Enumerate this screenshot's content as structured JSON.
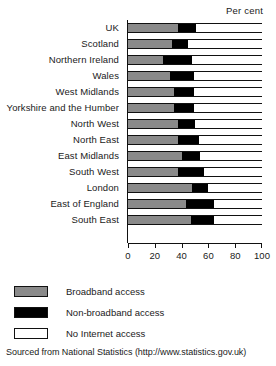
{
  "chart_data": {
    "type": "bar",
    "orientation": "horizontal",
    "stacked": true,
    "title": "",
    "subtitle": "",
    "unit_caption": "Per cent",
    "xlabel": "",
    "ylabel": "",
    "xlim": [
      0,
      100
    ],
    "xticks": [
      0,
      20,
      40,
      60,
      80,
      100
    ],
    "xtick_labels": [
      "0",
      "20",
      "40",
      "60",
      "80",
      "100"
    ],
    "grid": false,
    "legend_position": "below",
    "categories": [
      "UK",
      "Scotland",
      "Northern Ireland",
      "Wales",
      "West Midlands",
      "Yorkshire and the Humber",
      "North West",
      "North East",
      "East Midlands",
      "South West",
      "London",
      "East of England",
      "South East"
    ],
    "series": [
      {
        "name": "Broadband access",
        "color": "#8a8a8a",
        "values": [
          37,
          33,
          26,
          31,
          34,
          34,
          37,
          37,
          40,
          37,
          48,
          43,
          47
        ]
      },
      {
        "name": "Non-broadband access",
        "color": "#000000",
        "values": [
          14,
          12,
          22,
          18,
          15,
          15,
          13,
          16,
          14,
          20,
          12,
          21,
          17
        ]
      },
      {
        "name": "No Internet access",
        "color": "#ffffff",
        "values": [
          49,
          55,
          52,
          51,
          51,
          51,
          50,
          47,
          46,
          43,
          40,
          36,
          36
        ]
      }
    ],
    "source_note": "Sourced from National Statistics (http://www.statistics.gov.uk)"
  },
  "legend": {
    "items": [
      {
        "label": "Broadband access",
        "swatch": "broadband"
      },
      {
        "label": "Non-broadband access",
        "swatch": "nonbroadband"
      },
      {
        "label": "No Internet access",
        "swatch": "nointernet"
      }
    ]
  }
}
